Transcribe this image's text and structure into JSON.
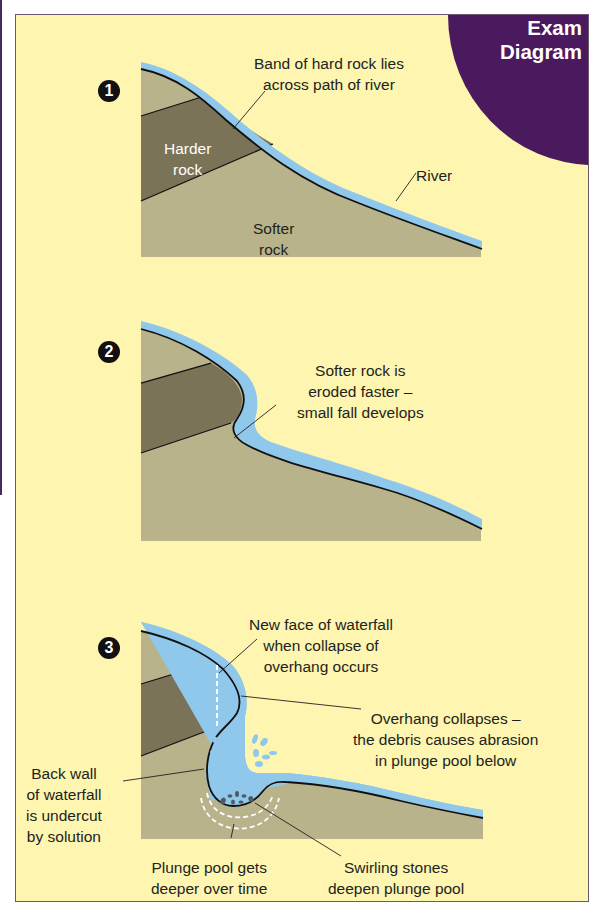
{
  "corner": {
    "line1": "Exam",
    "line2": "Diagram",
    "color": "#4b1a5e"
  },
  "colors": {
    "background": "#fdf5b0",
    "softer_rock": "#b8b38a",
    "harder_rock": "#7a7357",
    "water": "#8fc8ea",
    "outline": "#111111"
  },
  "stage1": {
    "number": "1",
    "label_band": [
      "Band of hard rock lies",
      "across path of river"
    ],
    "label_harder": [
      "Harder",
      "rock"
    ],
    "label_softer": [
      "Softer",
      "rock"
    ],
    "label_river": "River"
  },
  "stage2": {
    "number": "2",
    "label_eroded": [
      "Softer rock is",
      "eroded faster –",
      "small fall develops"
    ]
  },
  "stage3": {
    "number": "3",
    "label_new_face": [
      "New face of waterfall",
      "when collapse of",
      "overhang occurs"
    ],
    "label_overhang": [
      "Overhang collapses –",
      "the debris causes abrasion",
      "in plunge pool below"
    ],
    "label_back_wall": [
      "Back wall",
      "of waterfall",
      "is undercut",
      "by solution"
    ],
    "label_plunge_pool": [
      "Plunge pool gets",
      "deeper over time"
    ],
    "label_swirling": [
      "Swirling stones",
      "deepen plunge pool"
    ]
  }
}
